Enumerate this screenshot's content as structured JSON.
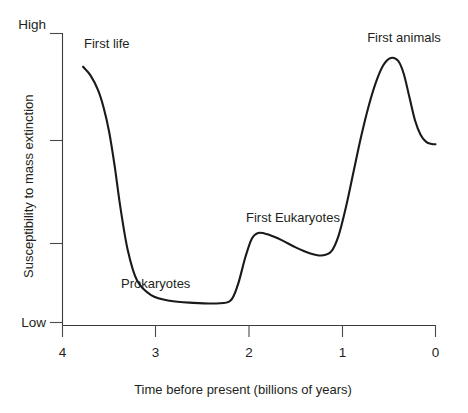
{
  "chart_data": {
    "type": "line",
    "title": "",
    "subtitle": "",
    "xlabel": "Time before present (billions of years)",
    "ylabel": "Susceptibility to mass extinction",
    "xlim": [
      4,
      0
    ],
    "ylim": [
      0,
      1
    ],
    "x_tick_labels": [
      "4",
      "3",
      "2",
      "1",
      "0"
    ],
    "x_tick_values": [
      4,
      3,
      2,
      1,
      0
    ],
    "y_tick_labels": [
      "High",
      "",
      "",
      "Low"
    ],
    "y_axis_bounds": {
      "high": "High",
      "low": "Low"
    },
    "y_tick_values": [
      1.0,
      0.635,
      0.28,
      0.01
    ],
    "grid": false,
    "legend": false,
    "legend_position": "none",
    "x_axis_direction": "reversed",
    "series": [
      {
        "name": "Susceptibility to mass extinction",
        "color": "#1a1a1a",
        "x": [
          3.78,
          3.7,
          3.62,
          3.56,
          3.5,
          3.44,
          3.38,
          3.3,
          3.2,
          3.05,
          2.85,
          2.6,
          2.35,
          2.2,
          2.12,
          2.04,
          1.97,
          1.9,
          1.8,
          1.65,
          1.5,
          1.35,
          1.22,
          1.12,
          1.04,
          0.96,
          0.88,
          0.8,
          0.72,
          0.64,
          0.56,
          0.48,
          0.4,
          0.34,
          0.28,
          0.22,
          0.16,
          0.1,
          0.04,
          0.0
        ],
        "y": [
          0.885,
          0.855,
          0.805,
          0.745,
          0.66,
          0.54,
          0.4,
          0.25,
          0.145,
          0.095,
          0.075,
          0.068,
          0.066,
          0.075,
          0.13,
          0.225,
          0.29,
          0.31,
          0.305,
          0.285,
          0.26,
          0.24,
          0.232,
          0.245,
          0.3,
          0.4,
          0.52,
          0.64,
          0.745,
          0.83,
          0.89,
          0.915,
          0.905,
          0.86,
          0.78,
          0.7,
          0.65,
          0.625,
          0.618,
          0.617
        ]
      }
    ],
    "annotations": [
      {
        "text": "First life",
        "x": 3.8,
        "y": 0.975,
        "align": "left"
      },
      {
        "text": "Prokaryotes",
        "x": 2.95,
        "y": 0.175,
        "align": "left"
      },
      {
        "text": "First Eukaryotes",
        "x": 2.12,
        "y": 0.425,
        "align": "center"
      },
      {
        "text": "First animals",
        "x": 0.53,
        "y": 1.015,
        "align": "center"
      }
    ]
  },
  "axes": {
    "x_title": "Time before present (billions of years)",
    "y_title": "Susceptibility to mass extinction",
    "x_ticks": [
      "4",
      "3",
      "2",
      "1",
      "0"
    ],
    "y_high": "High",
    "y_low": "Low"
  },
  "annotations": {
    "first_life": "First life",
    "prokaryotes": "Prokaryotes",
    "first_eukaryotes": "First Eukaryotes",
    "first_animals": "First animals"
  },
  "colors": {
    "curve": "#1a1a1a",
    "axis": "#3b3b3b",
    "text": "#231f20",
    "background": "#ffffff"
  }
}
